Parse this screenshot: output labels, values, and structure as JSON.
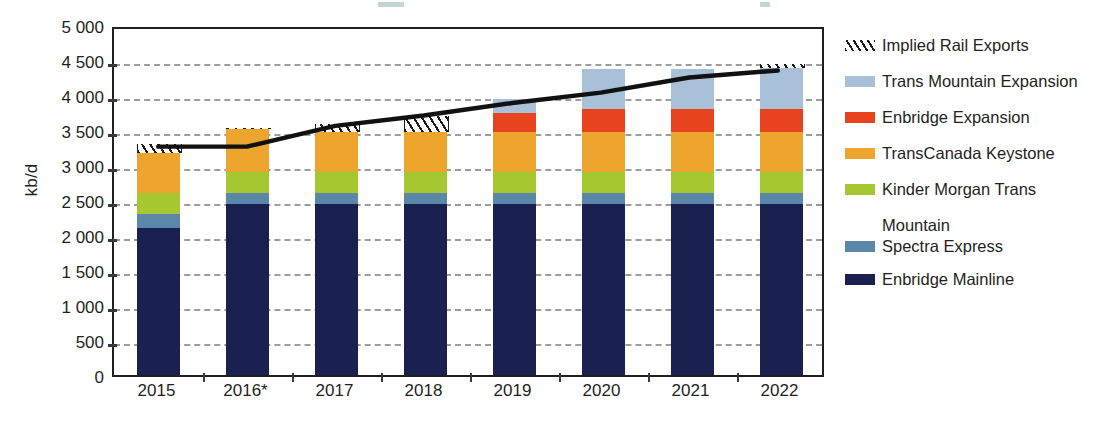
{
  "axis": {
    "ylabel": "kb/d",
    "yticks": [
      "5 000",
      "4 500",
      "4 000",
      "3 500",
      "3 000",
      "2 500",
      "2 000",
      "1 500",
      "1 000",
      "500",
      "0"
    ],
    "xlabels": [
      "2015",
      "2016*",
      "2017",
      "2018",
      "2019",
      "2020",
      "2021",
      "2022"
    ]
  },
  "legend": {
    "items": [
      {
        "label": "Implied Rail Exports",
        "color": "hatch",
        "icon": "hatch-swatch"
      },
      {
        "label": "Trans Mountain Expansion",
        "color": "#a8c0d8",
        "icon": "color-swatch"
      },
      {
        "label": "Enbridge Expansion",
        "color": "#e8431f",
        "icon": "color-swatch"
      },
      {
        "label": "TransCanada Keystone",
        "color": "#eda52e",
        "icon": "color-swatch"
      },
      {
        "label": "Kinder Morgan Trans",
        "label2": "Mountain",
        "color": "#a5c831",
        "icon": "color-swatch"
      },
      {
        "label": "Spectra Express",
        "color": "#5b88a8",
        "icon": "color-swatch"
      },
      {
        "label": "Enbridge Mainline",
        "color": "#1a2050",
        "icon": "color-swatch"
      }
    ]
  },
  "chart_data": {
    "type": "bar",
    "title": "",
    "xlabel": "",
    "ylabel": "kb/d",
    "ylim": [
      0,
      5000
    ],
    "ytick_step": 500,
    "grid": true,
    "legend_position": "right",
    "stacked": true,
    "categories": [
      "2015",
      "2016*",
      "2017",
      "2018",
      "2019",
      "2020",
      "2021",
      "2022"
    ],
    "series": [
      {
        "name": "Enbridge Mainline",
        "color": "#1a2050",
        "values": [
          2100,
          2450,
          2450,
          2450,
          2450,
          2450,
          2450,
          2450
        ]
      },
      {
        "name": "Spectra Express",
        "color": "#5b88a8",
        "values": [
          200,
          150,
          150,
          150,
          150,
          150,
          150,
          150
        ]
      },
      {
        "name": "Kinder Morgan Trans Mountain",
        "color": "#a5c831",
        "values": [
          300,
          300,
          300,
          300,
          300,
          300,
          300,
          300
        ]
      },
      {
        "name": "TransCanada Keystone",
        "color": "#eda52e",
        "values": [
          570,
          610,
          570,
          570,
          570,
          570,
          570,
          570
        ]
      },
      {
        "name": "Enbridge Expansion",
        "color": "#e8431f",
        "values": [
          0,
          0,
          0,
          0,
          280,
          330,
          330,
          330
        ]
      },
      {
        "name": "Trans Mountain Expansion",
        "color": "#a8c0d8",
        "values": [
          0,
          0,
          0,
          0,
          190,
          570,
          570,
          590
        ]
      },
      {
        "name": "Implied Rail Exports",
        "color": "hatch",
        "values": [
          130,
          20,
          110,
          230,
          0,
          0,
          0,
          60
        ]
      }
    ],
    "totals": [
      3300,
      3530,
      3580,
      3700,
      3940,
      4370,
      4370,
      4450
    ],
    "line": {
      "name": "Total oil supply requiring transportation",
      "color": "#111111",
      "values": [
        3300,
        3300,
        3600,
        3750,
        3930,
        4080,
        4300,
        4400
      ]
    }
  }
}
